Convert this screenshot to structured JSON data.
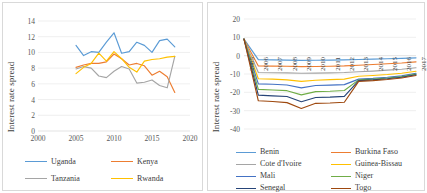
{
  "figure": {
    "panel_count": 2,
    "background": "#ffffff",
    "frame_color": "#d9d9d9"
  },
  "chart_data": [
    {
      "id": "east-africa",
      "type": "line",
      "title": "",
      "xlabel": "",
      "ylabel": "Interest rate spread",
      "xlim": [
        2000,
        2020
      ],
      "ylim": [
        0,
        14
      ],
      "xticks": [
        2000,
        2005,
        2010,
        2015,
        2020
      ],
      "yticks": [
        0,
        2,
        4,
        6,
        8,
        10,
        12,
        14
      ],
      "grid": true,
      "legend_position": "bottom",
      "x": [
        2005,
        2006,
        2007,
        2008,
        2009,
        2010,
        2011,
        2012,
        2013,
        2014,
        2015,
        2016,
        2017,
        2018
      ],
      "series": [
        {
          "name": "Uganda",
          "color": "#5b9bd5",
          "values": [
            10.9,
            9.6,
            10.1,
            10.0,
            11.3,
            12.5,
            9.9,
            10.1,
            11.3,
            10.9,
            10.0,
            11.5,
            11.7,
            10.7
          ]
        },
        {
          "name": "Kenya",
          "color": "#ed7d31",
          "values": [
            8.1,
            8.4,
            8.6,
            8.6,
            8.8,
            9.8,
            9.2,
            8.4,
            8.6,
            8.3,
            7.1,
            7.6,
            6.9,
            4.9
          ]
        },
        {
          "name": "Tanzania",
          "color": "#a5a5a5",
          "values": [
            7.9,
            8.2,
            8.0,
            7.0,
            6.8,
            7.6,
            8.2,
            7.9,
            6.1,
            6.2,
            6.5,
            5.8,
            5.5,
            9.5
          ]
        },
        {
          "name": "Rwanda",
          "color": "#ffc000",
          "values": [
            7.3,
            8.1,
            8.6,
            9.9,
            8.9,
            10.1,
            9.2,
            8.1,
            7.5,
            8.9,
            9.1,
            9.2,
            9.4,
            9.5
          ]
        }
      ]
    },
    {
      "id": "waemu",
      "type": "line",
      "title": "",
      "xlabel": "",
      "ylabel": "Interest rate spread",
      "ylim": [
        -40,
        20
      ],
      "yticks": [
        20,
        10,
        0,
        -10,
        -20,
        -30,
        -40
      ],
      "xticks": [
        2005,
        2006,
        2007,
        2008,
        2009,
        2010,
        2011,
        2012,
        2013,
        2014,
        2015,
        2016,
        2017
      ],
      "xtick_rotation": -90,
      "grid": true,
      "legend_position": "bottom",
      "x": [
        2005,
        2006,
        2007,
        2008,
        2009,
        2010,
        2011,
        2012,
        2013,
        2014,
        2015,
        2016,
        2017
      ],
      "series": [
        {
          "name": "Benin",
          "color": "#5b9bd5",
          "values": [
            9.0,
            -2.2,
            -2.3,
            -2.4,
            -2.6,
            -2.5,
            -2.4,
            -2.3,
            -2.1,
            -1.9,
            -1.7,
            -1.5,
            -1.2
          ]
        },
        {
          "name": "Burkina Faso",
          "color": "#ed7d31",
          "values": [
            9.0,
            -5.6,
            -5.7,
            -5.8,
            -6.0,
            -5.9,
            -5.8,
            -5.6,
            -5.2,
            -4.8,
            -4.4,
            -4.0,
            -3.4
          ]
        },
        {
          "name": "Cote d'Ivoire",
          "color": "#a5a5a5",
          "values": [
            9.0,
            -9.2,
            -9.3,
            -9.4,
            -9.6,
            -9.5,
            -9.4,
            -9.2,
            -8.8,
            -8.4,
            -7.9,
            -7.4,
            -6.6
          ]
        },
        {
          "name": "Guinea-Bissau",
          "color": "#ffc000",
          "values": [
            9.0,
            -12.6,
            -12.8,
            -13.2,
            -14.0,
            -13.4,
            -13.1,
            -12.8,
            -11.2,
            -10.8,
            -10.3,
            -9.6,
            -8.5
          ]
        },
        {
          "name": "Mali",
          "color": "#4472c4",
          "values": [
            9.0,
            -15.4,
            -15.6,
            -16.0,
            -17.6,
            -16.3,
            -16.1,
            -15.8,
            -12.8,
            -12.4,
            -11.8,
            -11.0,
            -9.6
          ]
        },
        {
          "name": "Niger",
          "color": "#70ad47",
          "values": [
            9.0,
            -18.4,
            -18.7,
            -19.1,
            -21.4,
            -19.6,
            -19.4,
            -19.0,
            -13.2,
            -12.8,
            -12.2,
            -11.4,
            -10.1
          ]
        },
        {
          "name": "Senegal",
          "color": "#264478",
          "values": [
            9.0,
            -21.5,
            -21.9,
            -22.3,
            -25.1,
            -22.8,
            -22.6,
            -22.2,
            -13.6,
            -13.2,
            -12.6,
            -11.8,
            -10.4
          ]
        },
        {
          "name": "Togo",
          "color": "#9e480e",
          "values": [
            9.0,
            -24.6,
            -25.0,
            -25.6,
            -28.8,
            -26.0,
            -25.8,
            -25.4,
            -14.0,
            -13.6,
            -13.0,
            -12.2,
            -10.8
          ]
        }
      ]
    }
  ],
  "left_chart": {
    "ylabel": "Interest rate spread",
    "yticks": [
      "14",
      "12",
      "10",
      "8",
      "6",
      "4",
      "2",
      "0"
    ],
    "xticks": [
      "2000",
      "2005",
      "2010",
      "2015",
      "2020"
    ],
    "legend": [
      {
        "label": "Uganda",
        "color": "#5b9bd5"
      },
      {
        "label": "Kenya",
        "color": "#ed7d31"
      },
      {
        "label": "Tanzania",
        "color": "#a5a5a5"
      },
      {
        "label": "Rwanda",
        "color": "#ffc000"
      }
    ]
  },
  "right_chart": {
    "ylabel": "Interest rate spread",
    "yticks": [
      "20",
      "10",
      "0",
      "-10",
      "-20",
      "-30",
      "-40"
    ],
    "xticks": [
      "2005",
      "2006",
      "2007",
      "2008",
      "2009",
      "2010",
      "2011",
      "2012",
      "2013",
      "2014",
      "2015",
      "2016",
      "2017"
    ],
    "legend": [
      {
        "label": "Benin",
        "color": "#5b9bd5"
      },
      {
        "label": "Burkina Faso",
        "color": "#ed7d31"
      },
      {
        "label": "Cote d'Ivoire",
        "color": "#a5a5a5"
      },
      {
        "label": "Guinea-Bissau",
        "color": "#ffc000"
      },
      {
        "label": "Mali",
        "color": "#4472c4"
      },
      {
        "label": "Niger",
        "color": "#70ad47"
      },
      {
        "label": "Senegal",
        "color": "#264478"
      },
      {
        "label": "Togo",
        "color": "#9e480e"
      }
    ]
  }
}
